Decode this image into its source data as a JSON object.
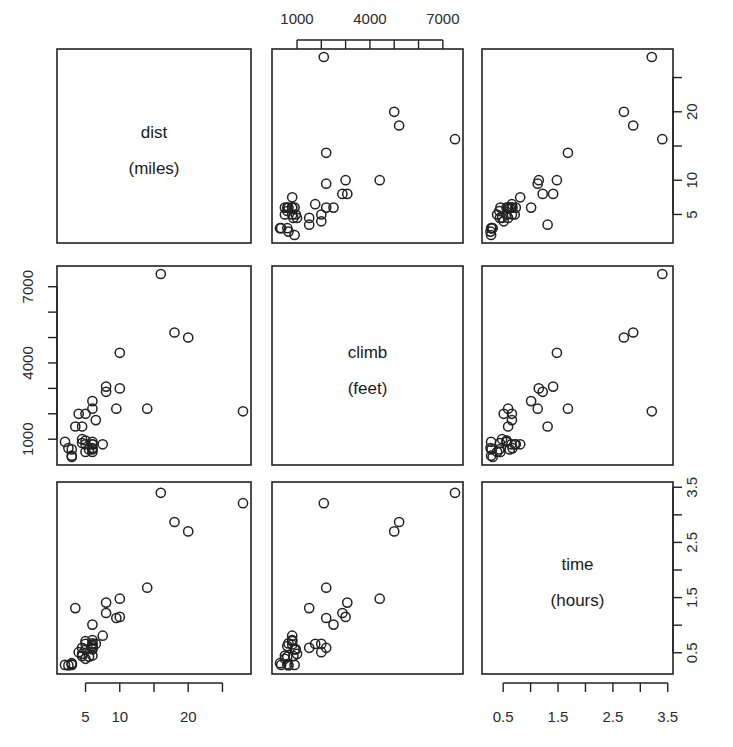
{
  "chart_data": {
    "type": "scatter",
    "kind": "scatterplot-matrix",
    "title": "",
    "variables": [
      {
        "key": "dist",
        "label": "dist",
        "unit": "(miles)",
        "range": [
          2,
          28
        ],
        "ticks": [
          5,
          10,
          15,
          20,
          25
        ],
        "tick_labels": [
          "5",
          "10",
          "",
          "20",
          ""
        ]
      },
      {
        "key": "climb",
        "label": "climb",
        "unit": "(feet)",
        "range": [
          300,
          7500
        ],
        "ticks": [
          1000,
          2000,
          3000,
          4000,
          5000,
          6000,
          7000
        ],
        "tick_labels": [
          "1000",
          "",
          "",
          "4000",
          "",
          "",
          "7000"
        ]
      },
      {
        "key": "time",
        "label": "time",
        "unit": "(hours)",
        "range": [
          0.26,
          3.45
        ],
        "ticks": [
          0.5,
          1.0,
          1.5,
          2.0,
          2.5,
          3.0,
          3.5
        ],
        "tick_labels": [
          "0.5",
          "",
          "1.5",
          "",
          "2.5",
          "",
          "3.5"
        ]
      }
    ],
    "axis_placement": {
      "top": "climb",
      "right_top": "dist",
      "left_middle": "climb",
      "right_bottom": "time",
      "bottom_left": "dist",
      "bottom_right": "time"
    },
    "points": {
      "dist": [
        2.5,
        6,
        6,
        7.5,
        8,
        8,
        16,
        6,
        5,
        6,
        28,
        5,
        9.5,
        6,
        4.5,
        10,
        14,
        3,
        4.5,
        5.5,
        3,
        3.5,
        6,
        2,
        3,
        4,
        6,
        5,
        6.5,
        5,
        10,
        6,
        18,
        4.5,
        20
      ],
      "climb": [
        650,
        2500,
        900,
        800,
        3070,
        2866,
        7500,
        800,
        800,
        650,
        2100,
        2000,
        2200,
        500,
        1500,
        3000,
        2200,
        350,
        1000,
        600,
        300,
        1500,
        2200,
        900,
        600,
        2000,
        800,
        950,
        1750,
        500,
        4400,
        600,
        5200,
        850,
        5000
      ],
      "time": [
        0.27,
        1.01,
        0.56,
        0.81,
        1.41,
        1.22,
        3.4,
        0.73,
        0.71,
        0.67,
        3.21,
        0.66,
        1.13,
        0.45,
        0.59,
        1.15,
        1.68,
        0.28,
        0.48,
        0.43,
        0.31,
        1.31,
        0.59,
        0.28,
        0.29,
        0.51,
        0.65,
        0.56,
        0.66,
        0.39,
        1.48,
        0.62,
        2.87,
        0.44,
        2.7
      ]
    },
    "point_style": "open circle",
    "grid": false,
    "legend": null
  }
}
